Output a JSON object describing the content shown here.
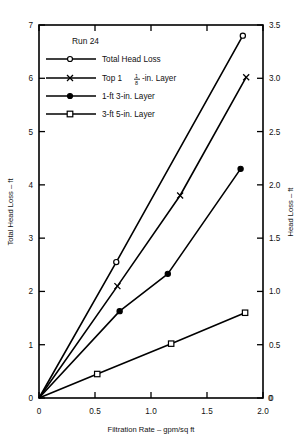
{
  "chart_data": {
    "type": "line",
    "title": "Run 24",
    "xlabel": "Filtration Rate – gpm/sq ft",
    "ylabel": "Total Head Loss – ft",
    "ylabel_right": "Head Loss – ft",
    "xlim": [
      0,
      2.0
    ],
    "ylim": [
      0,
      7
    ],
    "ylim_right": [
      0,
      3.5
    ],
    "grid": false,
    "legend_position": "top-left",
    "xticks": [
      "0",
      "0.5",
      "1.0",
      "1.5",
      "2.0"
    ],
    "xtick_values": [
      0,
      0.5,
      1.0,
      1.5,
      2.0
    ],
    "yticks": [
      "0",
      "1",
      "2",
      "3",
      "4",
      "5",
      "6",
      "7"
    ],
    "ytick_values": [
      0,
      1,
      2,
      3,
      4,
      5,
      6,
      7
    ],
    "yticks_right": [
      "0",
      "0.5",
      "1.0",
      "1.5",
      "2.0",
      "2.5",
      "3.0",
      "3.5"
    ],
    "ytick_right_values": [
      0,
      0.5,
      1.0,
      1.5,
      2.0,
      2.5,
      3.0,
      3.5
    ],
    "corner_label_right": "0",
    "series": [
      {
        "name": "Total Head Loss",
        "marker": "open-circle",
        "axis": "left",
        "x": [
          0,
          0.69,
          1.82
        ],
        "values": [
          0,
          2.55,
          6.8
        ]
      },
      {
        "name": "Top 1 1/8 -in. Layer",
        "marker": "cross",
        "axis": "left",
        "x": [
          0,
          0.7,
          1.26,
          1.85
        ],
        "values": [
          0,
          2.1,
          3.8,
          6.02
        ]
      },
      {
        "name": "1-ft 3-in. Layer",
        "marker": "filled-circle",
        "axis": "left",
        "x": [
          0,
          0.72,
          1.15,
          1.8
        ],
        "values": [
          0,
          1.63,
          2.33,
          4.3
        ]
      },
      {
        "name": "3-ft 5-in. Layer",
        "marker": "open-square",
        "axis": "left",
        "x": [
          0,
          0.52,
          1.18,
          1.84
        ],
        "values": [
          0,
          0.45,
          1.02,
          1.6
        ]
      }
    ],
    "legend": [
      {
        "label": "Total Head Loss",
        "marker": "open-circle"
      },
      {
        "label_prefix": "Top 1",
        "fraction_num": "1",
        "fraction_den": "8",
        "label_suffix": "-in. Layer",
        "marker": "cross"
      },
      {
        "label": "1-ft 3-in. Layer",
        "marker": "filled-circle"
      },
      {
        "label": "3-ft 5-in. Layer",
        "marker": "open-square"
      }
    ],
    "colors": {
      "line": "#000000",
      "axis": "#000000",
      "background": "#ffffff"
    }
  }
}
